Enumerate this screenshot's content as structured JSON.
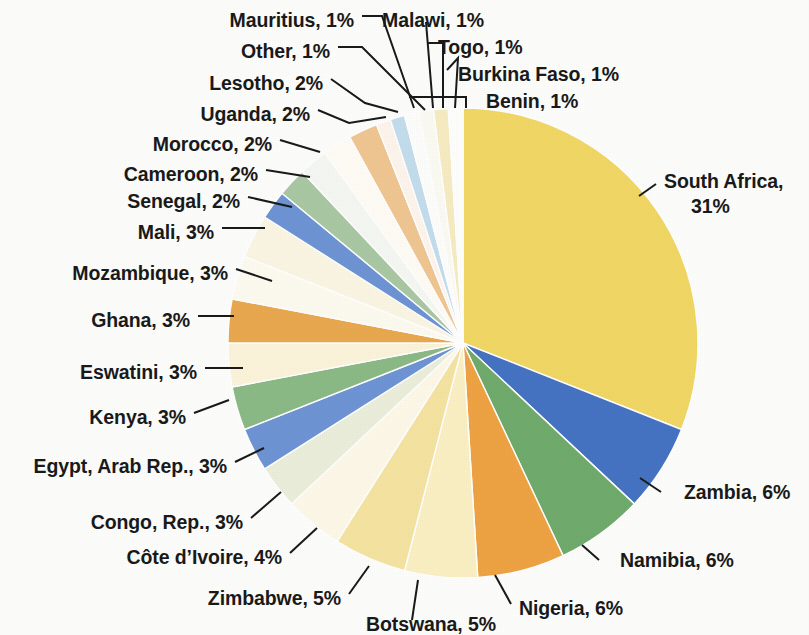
{
  "chart_data": {
    "type": "pie",
    "title": "",
    "subtitle": "",
    "xlabel": "",
    "ylabel": "",
    "legend_position": "callout-labels",
    "grid": false,
    "value_unit": "percent",
    "start_angle_deg": -90,
    "direction": "clockwise",
    "categories": [
      "South Africa",
      "Zambia",
      "Namibia",
      "Nigeria",
      "Botswana",
      "Zimbabwe",
      "Côte d’Ivoire",
      "Congo, Rep.",
      "Egypt, Arab Rep.",
      "Kenya",
      "Eswatini",
      "Ghana",
      "Mozambique",
      "Mali",
      "Senegal",
      "Cameroon",
      "Morocco",
      "Uganda",
      "Lesotho",
      "Other",
      "Mauritius",
      "Malawi",
      "Togo",
      "Burkina Faso",
      "Benin"
    ],
    "values": [
      31,
      6,
      6,
      6,
      5,
      5,
      4,
      3,
      3,
      3,
      3,
      3,
      3,
      3,
      2,
      2,
      2,
      2,
      2,
      1,
      1,
      1,
      1,
      1,
      1
    ],
    "labels": [
      "South Africa, 31%",
      "Zambia, 6%",
      "Namibia, 6%",
      "Nigeria, 6%",
      "Botswana, 5%",
      "Zimbabwe, 5%",
      "Côte d’Ivoire, 4%",
      "Congo, Rep., 3%",
      "Egypt, Arab Rep., 3%",
      "Kenya, 3%",
      "Eswatini, 3%",
      "Ghana, 3%",
      "Mozambique, 3%",
      "Mali, 3%",
      "Senegal, 2%",
      "Cameroon, 2%",
      "Morocco, 2%",
      "Uganda, 2%",
      "Lesotho, 2%",
      "Other, 1%",
      "Mauritius, 1%",
      "Malawi, 1%",
      "Togo, 1%",
      "Burkina Faso, 1%",
      "Benin, 1%"
    ],
    "colors": [
      "#f1d764",
      "#4574c4",
      "#6fac6c",
      "#efa342",
      "#fbf0c2",
      "#f5e3a0",
      "#fdf8e8",
      "#eceedb",
      "#6e94d4",
      "#8bba86",
      "#fbf4d9",
      "#eaa84f",
      "#fdfaf0",
      "#fbf5e2",
      "#6e94d4",
      "#a9c8a2",
      "#f5f8f2",
      "#fefcf5",
      "#f0c591",
      "#fdf4ec",
      "#c3ddee",
      "#fdfdfb",
      "#fbfaf3",
      "#f7ecc0",
      "#fefefc"
    ],
    "two_label_lines": {
      "South Africa, 31%": [
        "South Africa,",
        "31%"
      ]
    },
    "center": {
      "x": 463,
      "y": 343
    },
    "radius": 235,
    "background": "#fdfdfb",
    "text_color": "#1a1a1a",
    "leader_line_color": "#1a1a1a"
  },
  "labels_layout": [
    {
      "key": "mauritius",
      "text": "Mauritius, 1%",
      "x": 354,
      "y": 9,
      "align": "left"
    },
    {
      "key": "malawi",
      "text": "Malawi, 1%",
      "x": 382,
      "y": 9,
      "align": "right"
    },
    {
      "key": "other",
      "text": "Other, 1%",
      "x": 330,
      "y": 40,
      "align": "left"
    },
    {
      "key": "togo",
      "text": "Togo, 1%",
      "x": 438,
      "y": 36,
      "align": "right"
    },
    {
      "key": "lesotho",
      "text": "Lesotho, 2%",
      "x": 323,
      "y": 72,
      "align": "left"
    },
    {
      "key": "burkina-faso",
      "text": "Burkina Faso, 1%",
      "x": 458,
      "y": 63,
      "align": "right"
    },
    {
      "key": "uganda",
      "text": "Uganda, 2%",
      "x": 310,
      "y": 103,
      "align": "left"
    },
    {
      "key": "benin",
      "text": "Benin, 1%",
      "x": 486,
      "y": 90,
      "align": "right"
    },
    {
      "key": "morocco",
      "text": "Morocco, 2%",
      "x": 272,
      "y": 133,
      "align": "left"
    },
    {
      "key": "cameroon",
      "text": "Cameroon, 2%",
      "x": 258,
      "y": 163,
      "align": "left"
    },
    {
      "key": "senegal",
      "text": "Senegal, 2%",
      "x": 240,
      "y": 190,
      "align": "left"
    },
    {
      "key": "south-africa",
      "text": "South Africa,",
      "x": 664,
      "y": 170,
      "align": "right"
    },
    {
      "key": "south-africa-pct",
      "text": "31%",
      "x": 691,
      "y": 195,
      "align": "right"
    },
    {
      "key": "mali",
      "text": "Mali, 3%",
      "x": 214,
      "y": 221,
      "align": "left"
    },
    {
      "key": "mozambique",
      "text": "Mozambique, 3%",
      "x": 228,
      "y": 262,
      "align": "left"
    },
    {
      "key": "ghana",
      "text": "Ghana, 3%",
      "x": 190,
      "y": 309,
      "align": "left"
    },
    {
      "key": "eswatini",
      "text": "Eswatini, 3%",
      "x": 197,
      "y": 361,
      "align": "left"
    },
    {
      "key": "kenya",
      "text": "Kenya, 3%",
      "x": 186,
      "y": 406,
      "align": "left"
    },
    {
      "key": "egypt",
      "text": "Egypt, Arab Rep., 3%",
      "x": 227,
      "y": 455,
      "align": "left"
    },
    {
      "key": "congo",
      "text": "Congo, Rep., 3%",
      "x": 243,
      "y": 511,
      "align": "left"
    },
    {
      "key": "zambia",
      "text": "Zambia, 6%",
      "x": 684,
      "y": 481,
      "align": "right"
    },
    {
      "key": "cote-divoire",
      "text": "Côte d’Ivoire, 4%",
      "x": 282,
      "y": 546,
      "align": "left"
    },
    {
      "key": "namibia",
      "text": "Namibia, 6%",
      "x": 620,
      "y": 549,
      "align": "right"
    },
    {
      "key": "zimbabwe",
      "text": "Zimbabwe, 5%",
      "x": 341,
      "y": 587,
      "align": "left"
    },
    {
      "key": "nigeria",
      "text": "Nigeria, 6%",
      "x": 519,
      "y": 597,
      "align": "right"
    },
    {
      "key": "botswana",
      "text": "Botswana, 5%",
      "x": 366,
      "y": 613,
      "align": "right"
    }
  ],
  "leader_lines": [
    {
      "key": "mauritius",
      "points": "362,16 382,16 414,108"
    },
    {
      "key": "malawi",
      "points": "426,22 433,108"
    },
    {
      "key": "other",
      "points": "338,47 362,47 425,110"
    },
    {
      "key": "togo",
      "points": "428,43 443,43 443,108"
    },
    {
      "key": "lesotho",
      "points": "331,79 365,103 398,112"
    },
    {
      "key": "burkina-faso",
      "points": "447,70 458,58 455,108"
    },
    {
      "key": "uganda",
      "points": "318,110 349,123 386,117"
    },
    {
      "key": "benin",
      "points": "409,97 466,97 466,108"
    },
    {
      "key": "morocco",
      "points": "280,140 320,152"
    },
    {
      "key": "cameroon",
      "points": "266,170 310,177"
    },
    {
      "key": "senegal",
      "points": "248,197 292,207"
    },
    {
      "key": "south-africa",
      "points": "639,196 656,184"
    },
    {
      "key": "mali",
      "points": "222,228 265,228"
    },
    {
      "key": "mozambique",
      "points": "236,269 272,281"
    },
    {
      "key": "ghana",
      "points": "198,316 234,316"
    },
    {
      "key": "eswatini",
      "points": "205,368 243,368"
    },
    {
      "key": "kenya",
      "points": "194,413 229,400"
    },
    {
      "key": "egypt",
      "points": "235,462 264,448"
    },
    {
      "key": "congo",
      "points": "251,518 281,492"
    },
    {
      "key": "zambia",
      "points": "661,492 640,478"
    },
    {
      "key": "cote-divoire",
      "points": "290,553 317,528"
    },
    {
      "key": "namibia",
      "points": "599,560 582,545"
    },
    {
      "key": "zimbabwe",
      "points": "349,594 369,566"
    },
    {
      "key": "nigeria",
      "points": "511,604 495,575"
    },
    {
      "key": "botswana",
      "points": "412,620 418,580"
    }
  ]
}
